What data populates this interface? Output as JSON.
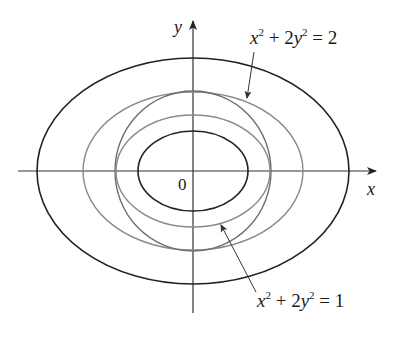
{
  "figure": {
    "axes": {
      "x_label": "x",
      "y_label": "y",
      "origin_label": "0"
    },
    "curves": [
      {
        "name": "outer-ellipse",
        "stroke": "#222222",
        "role": "level curve"
      },
      {
        "name": "ellipse-x2-2y2-eq-2",
        "stroke": "#8a8a8a",
        "equation": "x^2 + 2y^2 = 2"
      },
      {
        "name": "circle",
        "stroke": "#6e6e6e",
        "role": "constraint"
      },
      {
        "name": "ellipse-x2-2y2-eq-1",
        "stroke": "#8a8a8a",
        "equation": "x^2 + 2y^2 = 1"
      },
      {
        "name": "inner-ellipse",
        "stroke": "#222222",
        "role": "level curve"
      }
    ],
    "annotations": {
      "upper": {
        "x_var": "x",
        "x_exp": "2",
        "plus": " + 2",
        "y_var": "y",
        "y_exp": "2",
        "rhs": " = 2"
      },
      "lower": {
        "x_var": "x",
        "x_exp": "2",
        "plus": " + 2",
        "y_var": "y",
        "y_exp": "2",
        "rhs": " = 1"
      }
    },
    "colors": {
      "dark": "#222222",
      "gray": "#8a8a8a",
      "mid": "#6e6e6e",
      "background": "#ffffff"
    }
  }
}
